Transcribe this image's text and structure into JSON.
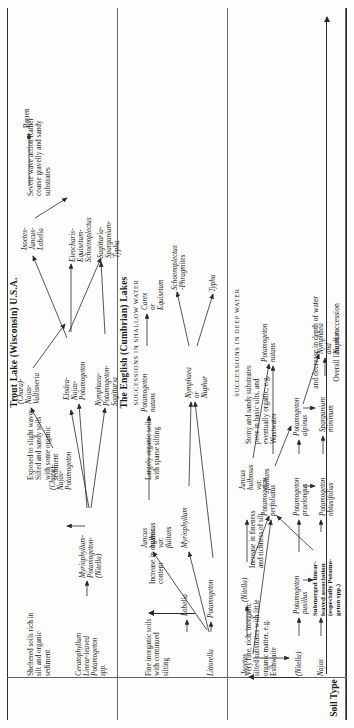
{
  "figure": {
    "stub_label": "Soil\nType",
    "overall_caption_top": "and decrease in depth of water",
    "overall_caption_bottom": "Overall line of succession"
  },
  "panels": [
    {
      "id": "trout",
      "title": "Trout Lake (Wisconsin) U.S.A.",
      "section_head": "",
      "soil_columns": [
        "Sheltered\nsoils rich in\nsilt and\norganic\nsediment",
        "Exposed to\nslight waves\nSilted and\nsandy soils\nwith some\norganic\nsediment",
        "Severe wave\naction\nRather coarse\ngravelly and\nsandy\nsubstrates"
      ],
      "nodes": [
        "Ceratophyllum\nLinear-leaved\nPotamogeton\nspp.",
        "Myriophyllum-\nPotamogeton-\n(Nitella)",
        "(Chara)-\nNajas-\nPotamogeton",
        "(Chara)-\nNajas-\nVallisneria",
        "Elodea-\nNajas-\nPotamogeton",
        "Nymphaea-\nPotamogeton-\nSagittaria",
        "Isoetes-\nJuncus-\nLobelia",
        "Eleocharis-\nEquisetum-\nSchoenoplectus",
        "Sagittaria-\nSparganium-\nTypha",
        "Barren"
      ]
    },
    {
      "id": "shallow",
      "title": "The English (Cumbrian) Lakes",
      "section_head": "SUCCESSIONS IN SHALLOW WATER",
      "soil_columns": [
        "Fine inorganic\nsoils with\ncontinued\nsilting",
        "Increase in\norganic content",
        "Largely\norganic soils\nwith sparse\nsilting"
      ],
      "nodes": [
        "Littorella",
        "Lobelia",
        "Potamogeton",
        "Myriophyllum",
        "Juncus\nbulbosus\nvar.\nfluitans",
        "Nymphaea\nor\nNuphar",
        "Potamogeton\nnatans",
        "Schoenoplectus\n-Phragmites",
        "Typha",
        "Carex\nor\nEquisetum"
      ]
    },
    {
      "id": "deep",
      "title": "",
      "section_head": "SUCCESSIONS IN DEEP WATER",
      "soil_columns": [
        "Very fine, rich,\ninorganic silted\nsubstrates with\nlittle organic\nmatter, e.g.\nEsthwaite",
        "Increase in\nfineness and\nrichness of\nsilt",
        "Stony and sandy\nsubstrates poor\nin basic silts,\nand eventually\norganic; e.g.\nWastwater"
      ],
      "nodes": [
        "Najas",
        "(Nitella)",
        "Isoetes",
        "(Nitella)",
        "Potamogeton\npusillus",
        "Submerged linear-\nleaved association\n(especially Potamo-\ngeton spp.)",
        "Potamogeton\npraelongus",
        "Potamogeton\nobtusifolius",
        "Potamogeton\nalpinus",
        "Sparganium\nminimum",
        "Juncus\nbulbosus\nvar.\nfluitans",
        "Potamogeton\nperfoliatus",
        "Potamogeton\nnatans",
        "Nymphaea\nand\nNuphar"
      ]
    }
  ],
  "colors": {
    "ink": "#1a1a1a",
    "rule": "#2a2a2a",
    "paper": "#fdfdfc"
  }
}
